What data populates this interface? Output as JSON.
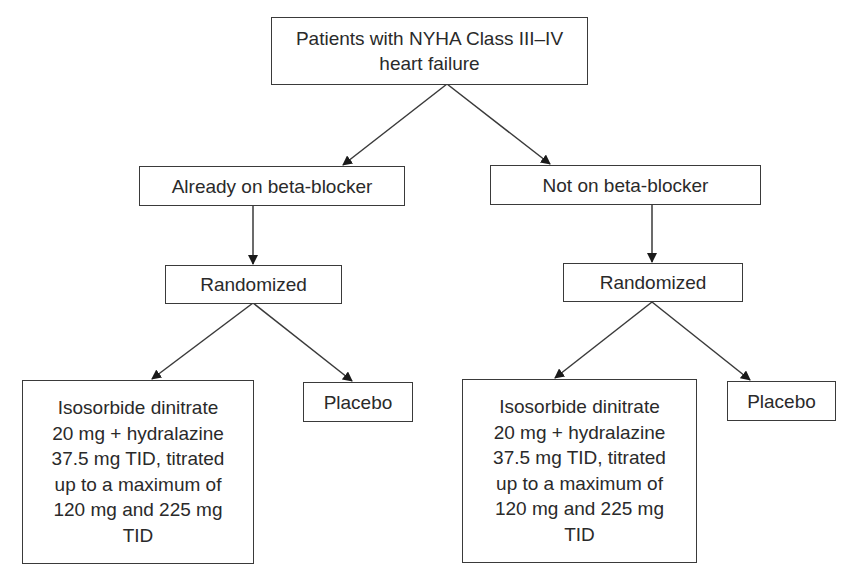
{
  "diagram": {
    "type": "flowchart",
    "nodes": {
      "root": {
        "label": "Patients with NYHA Class III–IV\nheart failure"
      },
      "on_bb": {
        "label": "Already on beta-blocker"
      },
      "not_bb": {
        "label": "Not on beta-blocker"
      },
      "rand_left": {
        "label": "Randomized"
      },
      "rand_right": {
        "label": "Randomized"
      },
      "treat_left": {
        "label": "Isosorbide dinitrate\n20 mg + hydralazine\n37.5 mg TID, titrated\nup to a maximum of\n120 mg and 225 mg\nTID"
      },
      "placebo_left": {
        "label": "Placebo"
      },
      "treat_right": {
        "label": "Isosorbide dinitrate\n20 mg + hydralazine\n37.5 mg TID, titrated\nup to a maximum of\n120 mg and 225 mg\nTID"
      },
      "placebo_right": {
        "label": "Placebo"
      }
    },
    "edges": [
      {
        "from": "root",
        "to": "on_bb"
      },
      {
        "from": "root",
        "to": "not_bb"
      },
      {
        "from": "on_bb",
        "to": "rand_left"
      },
      {
        "from": "not_bb",
        "to": "rand_right"
      },
      {
        "from": "rand_left",
        "to": "treat_left"
      },
      {
        "from": "rand_left",
        "to": "placebo_left"
      },
      {
        "from": "rand_right",
        "to": "treat_right"
      },
      {
        "from": "rand_right",
        "to": "placebo_right"
      }
    ],
    "colors": {
      "line": "#3a3a3a",
      "text": "#2a2a2a",
      "background": "#ffffff"
    }
  }
}
